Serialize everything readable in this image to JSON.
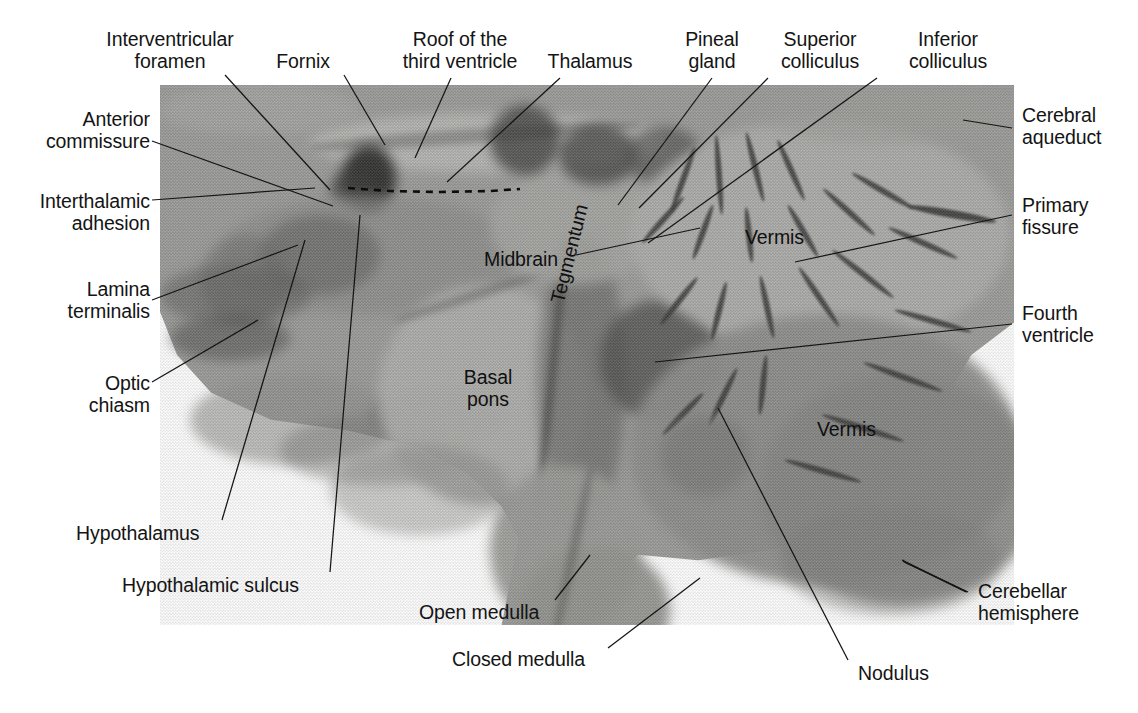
{
  "figure": {
    "image_alt": "Black and white photograph of a midsagittal brain specimen"
  },
  "labels": {
    "interventricular_foramen": "Interventricular\nforamen",
    "fornix": "Fornix",
    "roof_third_ventricle": "Roof of the\nthird ventricle",
    "thalamus": "Thalamus",
    "pineal_gland": "Pineal\ngland",
    "superior_colliculus": "Superior\ncolliculus",
    "inferior_colliculus": "Inferior\ncolliculus",
    "anterior_commissure": "Anterior\ncommissure",
    "interthalamic_adhesion": "Interthalamic\nadhesion",
    "lamina_terminalis": "Lamina\nterminalis",
    "optic_chiasm": "Optic\nchiasm",
    "hypothalamus": "Hypothalamus",
    "hypothalamic_sulcus": "Hypothalamic sulcus",
    "open_medulla": "Open medulla",
    "closed_medulla": "Closed medulla",
    "cerebral_aqueduct": "Cerebral\naqueduct",
    "primary_fissure": "Primary\nfissure",
    "fourth_ventricle": "Fourth\nventricle",
    "cerebellar_hemisphere": "Cerebellar\nhemisphere",
    "nodulus": "Nodulus",
    "midbrain": "Midbrain",
    "vermis_upper": "Vermis",
    "vermis_lower": "Vermis",
    "basal_pons": "Basal\npons",
    "tegmentum": "Tegmentum"
  },
  "colors": {
    "text": "#141414",
    "leader_line": "#151515",
    "page_background": "#ffffff",
    "specimen_mid": "#9b9b99",
    "specimen_dark": "#4a4a48",
    "specimen_light": "#c3c3c0"
  }
}
